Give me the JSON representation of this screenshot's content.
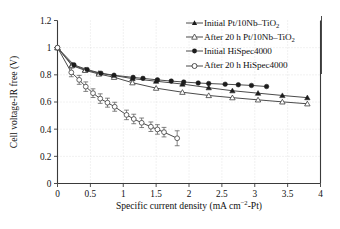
{
  "chart_data": {
    "type": "line",
    "title": "",
    "xlabel": "Specific current density (mA cm−2-Pt)",
    "xlabel_main": "Specific current density (mA cm",
    "xlabel_sup": "−2",
    "xlabel_tail": "-Pt)",
    "ylabel": "Cell voltage-IR free (V)",
    "xlim": [
      0,
      4
    ],
    "ylim": [
      0,
      1.2
    ],
    "xticks": [
      0,
      0.5,
      1,
      1.5,
      2,
      2.5,
      3,
      3.5,
      4
    ],
    "xtick_labels": [
      "0",
      "0.5",
      "1",
      "1.5",
      "2",
      "2.5",
      "3",
      "3.5",
      "4"
    ],
    "yticks": [
      0,
      0.2,
      0.4,
      0.6,
      0.8,
      1,
      1.2
    ],
    "ytick_labels": [
      "0",
      "0.2",
      "0.4",
      "0.6",
      "0.8",
      "1",
      "1.2"
    ],
    "grid": true,
    "legend_position": "upper-right",
    "series": [
      {
        "name": "Initial Pt/10Nb–TiO2",
        "label_main": "Initial Pt/10Nb–TiO",
        "label_sub": "2",
        "marker": "filled-triangle",
        "x": [
          0.0,
          0.22,
          0.42,
          0.63,
          0.86,
          1.14,
          1.5,
          1.9,
          2.3,
          2.66,
          3.05,
          3.42,
          3.8
        ],
        "y": [
          1.0,
          0.875,
          0.838,
          0.812,
          0.795,
          0.772,
          0.753,
          0.732,
          0.705,
          0.683,
          0.665,
          0.648,
          0.632
        ]
      },
      {
        "name": "After 20 h Pt/10Nb–TiO2",
        "label_main": "After 20 h Pt/10Nb–TiO",
        "label_sub": "2",
        "marker": "open-triangle",
        "x": [
          0.0,
          0.22,
          0.42,
          0.63,
          0.86,
          1.14,
          1.5,
          1.9,
          2.3,
          2.66,
          3.05,
          3.42,
          3.8
        ],
        "y": [
          1.0,
          0.868,
          0.833,
          0.806,
          0.782,
          0.742,
          0.702,
          0.672,
          0.648,
          0.632,
          0.616,
          0.601,
          0.587
        ]
      },
      {
        "name": "Initial HiSpec4000",
        "label_main": "Initial HiSpec4000",
        "label_sub": "",
        "marker": "filled-circle",
        "x": [
          0.0,
          0.25,
          0.45,
          0.66,
          0.86,
          1.15,
          1.3,
          1.52,
          1.73,
          1.92,
          2.14,
          2.3,
          2.55,
          2.75,
          2.95,
          3.18
        ],
        "y": [
          1.0,
          0.873,
          0.839,
          0.812,
          0.797,
          0.781,
          0.774,
          0.763,
          0.754,
          0.747,
          0.74,
          0.736,
          0.731,
          0.727,
          0.722,
          0.714
        ]
      },
      {
        "name": "After 20 h HiSpec4000",
        "label_main": "After 20 h HiSpec4000",
        "label_sub": "",
        "marker": "open-circle",
        "x": [
          0.0,
          0.21,
          0.33,
          0.43,
          0.54,
          0.65,
          0.76,
          0.87,
          1.05,
          1.16,
          1.28,
          1.42,
          1.52,
          1.62,
          1.82
        ],
        "y": [
          1.0,
          0.818,
          0.763,
          0.713,
          0.665,
          0.625,
          0.595,
          0.565,
          0.505,
          0.475,
          0.447,
          0.418,
          0.398,
          0.378,
          0.333
        ],
        "yerr": [
          0.0,
          0.032,
          0.033,
          0.035,
          0.032,
          0.035,
          0.033,
          0.033,
          0.035,
          0.035,
          0.035,
          0.035,
          0.035,
          0.035,
          0.055
        ]
      }
    ]
  },
  "legend": {
    "items": [
      {
        "label_main": "Initial Pt/10Nb–TiO",
        "label_sub": "2",
        "marker": "filled-triangle"
      },
      {
        "label_main": "After 20 h Pt/10Nb–TiO",
        "label_sub": "2",
        "marker": "open-triangle"
      },
      {
        "label_main": "Initial HiSpec4000",
        "label_sub": "",
        "marker": "filled-circle"
      },
      {
        "label_main": "After 20 h HiSpec4000",
        "label_sub": "",
        "marker": "open-circle"
      }
    ]
  },
  "colors": {
    "axis": "#3a3a3a",
    "grid": "#c9c9c9",
    "line": "#4b4b4b",
    "marker_fill": "#1c1c1c",
    "marker_open": "#ffffff",
    "background": "#ffffff"
  }
}
